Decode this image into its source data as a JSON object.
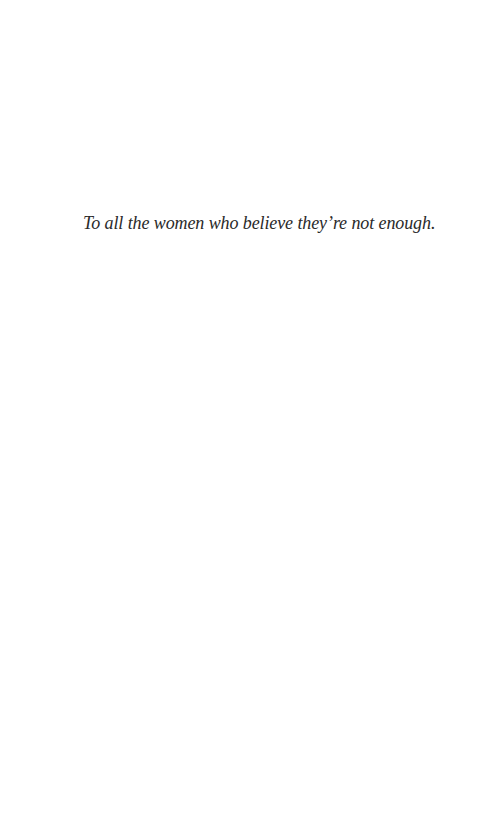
{
  "page": {
    "type": "dedication",
    "background_color": "#ffffff",
    "text_color": "#2a2a2a"
  },
  "dedication": {
    "text": "To all the women who believe they’re not enough."
  }
}
